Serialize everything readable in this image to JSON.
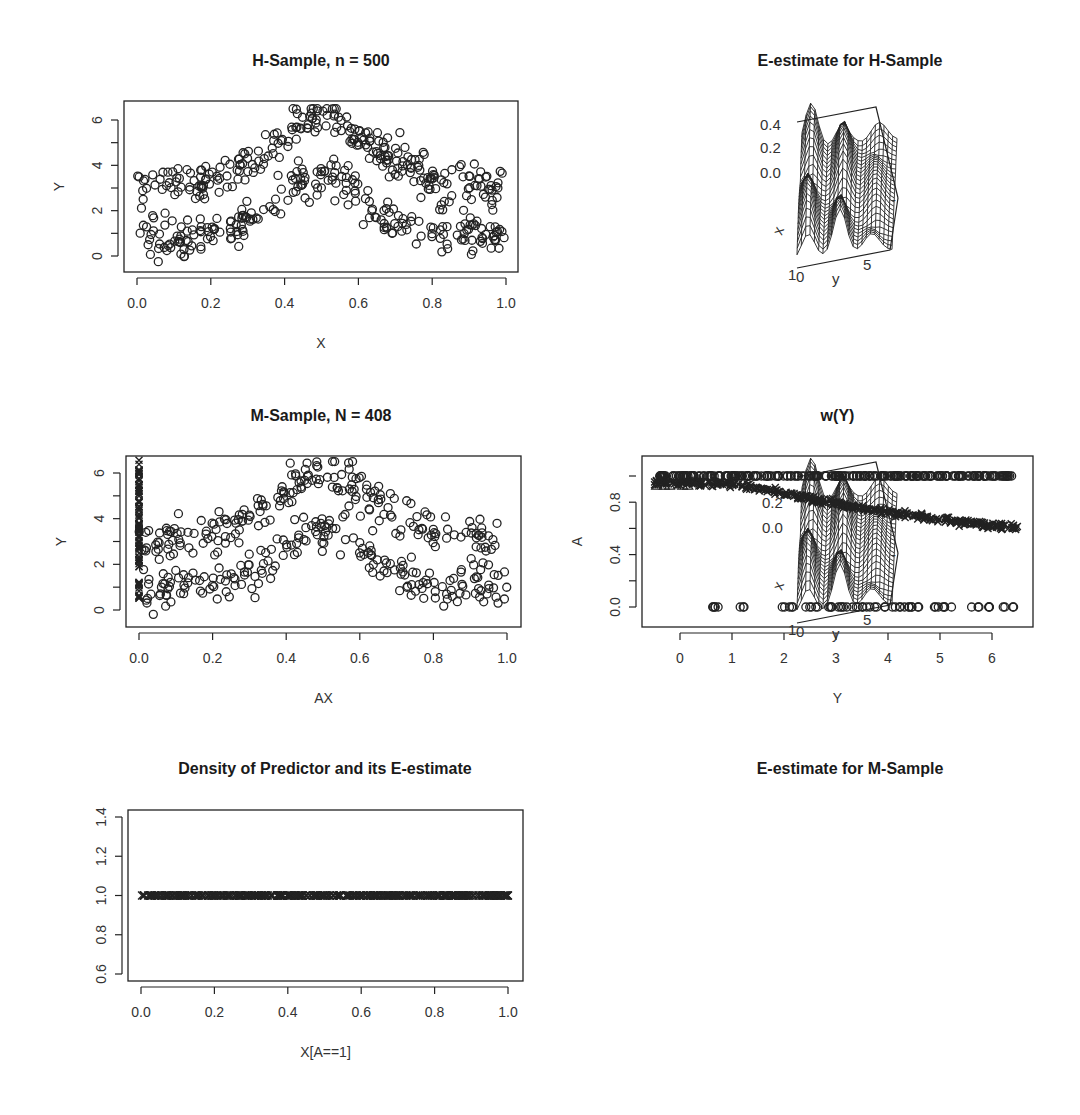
{
  "page": {
    "width": 1080,
    "height": 1115
  },
  "chart_data": [
    {
      "id": "h-sample",
      "type": "scatter",
      "title": "H-Sample,  n =  500",
      "xlabel": "X",
      "ylabel": "Y",
      "xlim": [
        0.0,
        1.0
      ],
      "ylim": [
        -0.5,
        6.6
      ],
      "xticks": [
        "0.0",
        "0.2",
        "0.4",
        "0.6",
        "0.8",
        "1.0"
      ],
      "yticks": [
        "0",
        "2",
        "4",
        "6"
      ],
      "n_points": 500,
      "marker": "open-circle",
      "description": "Two-band pattern: upper band ~3 at X=0 rising to ~6 at X=0.5 then back to ~3 at X=1; lower band ~1 at X=0 rising to ~3.5 at X=0.5 and down to ~0.5 at X=1",
      "grid": false
    },
    {
      "id": "e-estimate-h",
      "type": "surface3d",
      "title": "E-estimate for H-Sample",
      "zticks": [
        "0.4",
        "0.2",
        "0.0"
      ],
      "axis_labels": {
        "x": "x",
        "y": "y"
      },
      "corner_ticks": {
        "x": "1",
        "y0": "0",
        "y5": "5"
      }
    },
    {
      "id": "m-sample",
      "type": "scatter",
      "title": "M-Sample,  N =  408",
      "xlabel": "AX",
      "ylabel": "Y",
      "xlim": [
        0.0,
        1.0
      ],
      "ylim": [
        -0.5,
        6.6
      ],
      "xticks": [
        "0.0",
        "0.2",
        "0.4",
        "0.6",
        "0.8",
        "1.0"
      ],
      "yticks": [
        "0",
        "2",
        "4",
        "6"
      ],
      "n_points": 408,
      "marker": "open-circle; cross markers stacked at AX=0 (missing cases)",
      "grid": false
    },
    {
      "id": "w-of-y",
      "type": "scatter",
      "title": "w(Y)",
      "xlabel": "Y",
      "ylabel": "A",
      "xlim": [
        -0.5,
        6.6
      ],
      "ylim": [
        -0.1,
        1.05
      ],
      "xticks": [
        "0",
        "1",
        "2",
        "3",
        "4",
        "5",
        "6"
      ],
      "yticks": [
        "0.0",
        "0.4",
        "0.8"
      ],
      "series": [
        {
          "name": "A = 1 (observed)",
          "marker": "open-circle",
          "y": 1.0,
          "x_range": [
            -0.4,
            6.4
          ]
        },
        {
          "name": "A = 0 (missing)",
          "marker": "open-circle",
          "y": 0.0,
          "x_range": [
            0.5,
            6.5
          ]
        },
        {
          "name": "w(Y) estimate",
          "marker": "triangle/cross",
          "x": [
            -0.5,
            0,
            1,
            2,
            3,
            4,
            5,
            6,
            6.5
          ],
          "values": [
            0.95,
            0.95,
            0.94,
            0.87,
            0.79,
            0.72,
            0.67,
            0.62,
            0.61
          ]
        }
      ],
      "grid": false
    },
    {
      "id": "density-predictor",
      "type": "scatter",
      "title": "Density of Predictor and its E-estimate",
      "xlabel": "X[A==1]",
      "ylabel": "",
      "xlim": [
        0.0,
        1.0
      ],
      "ylim": [
        0.6,
        1.4
      ],
      "xticks": [
        "0.0",
        "0.2",
        "0.4",
        "0.6",
        "0.8",
        "1.0"
      ],
      "yticks": [
        "0.6",
        "0.8",
        "1.0",
        "1.2",
        "1.4"
      ],
      "series": [
        {
          "name": "density estimate",
          "marker": "cross",
          "y": 1.0,
          "x_range": [
            0.0,
            1.0
          ]
        }
      ],
      "grid": false
    },
    {
      "id": "e-estimate-m",
      "type": "surface3d",
      "title": "E-estimate for M-Sample",
      "zticks": [
        "0.2",
        "0.0"
      ],
      "axis_labels": {
        "x": "x",
        "y": "y"
      },
      "corner_ticks": {
        "x": "1",
        "y0": "0",
        "y5": "5"
      }
    }
  ]
}
